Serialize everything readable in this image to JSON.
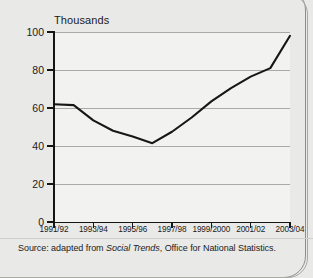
{
  "chart_data": {
    "type": "line",
    "title": "",
    "ylabel": "Thousands",
    "xlabel": "",
    "ylim": [
      0,
      100
    ],
    "yticks": [
      0,
      20,
      40,
      60,
      80,
      100
    ],
    "grid": true,
    "legend": null,
    "categories": [
      "1991/92",
      "1992/93",
      "1993/94",
      "1994/95",
      "1995/96",
      "1996/97",
      "1997/98",
      "1998/99",
      "1999/2000",
      "2000/01",
      "2001/02",
      "2002/03",
      "2003/04"
    ],
    "xtick_labels": [
      "1991/92",
      "1993/94",
      "1995/96",
      "1997/98",
      "1999/2000",
      "2001/02",
      "2003/04"
    ],
    "series": [
      {
        "name": "Thousands",
        "values": [
          62,
          61.5,
          53.5,
          48,
          45,
          41.5,
          47.5,
          55,
          63.5,
          70.5,
          76.5,
          81,
          98
        ]
      }
    ]
  },
  "axis": {
    "unit_label": "Thousands",
    "y_tick_labels": [
      "0",
      "20",
      "40",
      "60",
      "80",
      "100"
    ]
  },
  "footer": {
    "source_prefix": "Source: adapted from ",
    "source_italic": "Social Trends",
    "source_suffix": ", Office for National Statistics."
  },
  "colors": {
    "line": "#171717",
    "grid": "#a9a9a6",
    "axis": "#151515",
    "plot_bg": "#f2f2f1",
    "page_bg": "#e9e9e7"
  }
}
